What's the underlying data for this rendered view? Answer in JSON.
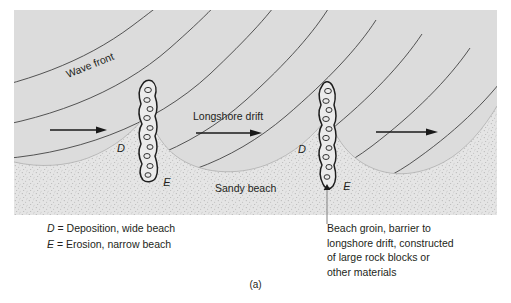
{
  "figure": {
    "label": "(a)",
    "panel": {
      "labels": {
        "wave_front": "Wave front",
        "longshore_drift": "Longshore drift",
        "sandy_beach": "Sandy beach",
        "deposition_left": "D",
        "erosion_left": "E",
        "deposition_right": "D",
        "erosion_right": "E"
      }
    },
    "captions": {
      "legend": [
        {
          "symbol": "D",
          "equals": "=",
          "text": "Deposition, wide beach"
        },
        {
          "symbol": "E",
          "equals": "=",
          "text": "Erosion, narrow beach"
        }
      ],
      "groin_note": [
        "Beach groin, barrier to",
        "longshore drift, constructed",
        "of large rock blocks or",
        "other materials"
      ]
    },
    "colors": {
      "ocean": "#dcdcdc",
      "surf_shading": "#c4c4c4",
      "sand": "#e3e3e3",
      "stipple": "#9a9a9a",
      "line": "#3a3a3a",
      "text": "#231f20",
      "groin_fill": "#e8e8e8",
      "background": "#ffffff"
    },
    "counts": {
      "wave_front_lines": 9,
      "drift_arrows": 3,
      "groins": 2
    }
  }
}
